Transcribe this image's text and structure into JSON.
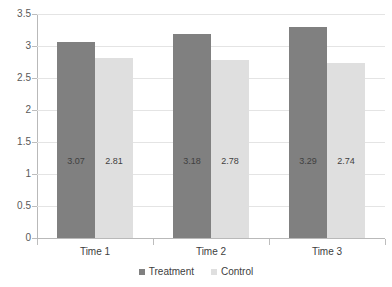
{
  "chart_data": {
    "type": "bar",
    "title": "",
    "xlabel": "",
    "ylabel": "",
    "categories": [
      "Time 1",
      "Time 2",
      "Time 3"
    ],
    "series": [
      {
        "name": "Treatment",
        "color": "#808080",
        "values": [
          3.07,
          3.18,
          3.29
        ]
      },
      {
        "name": "Control",
        "color": "#dfdfdf",
        "values": [
          2.81,
          2.78,
          2.74
        ]
      }
    ],
    "data_labels": [
      [
        "3.07",
        "2.81"
      ],
      [
        "3.18",
        "2.78"
      ],
      [
        "3.29",
        "2.74"
      ]
    ],
    "ylim": [
      0,
      3.5
    ],
    "ytick_step": 0.5,
    "yticks": [
      "0",
      "0.5",
      "1",
      "1.5",
      "2",
      "2.5",
      "3",
      "3.5"
    ],
    "ytick_values": [
      0,
      0.5,
      1,
      1.5,
      2,
      2.5,
      3,
      3.5
    ],
    "grid": true,
    "legend_position": "bottom"
  }
}
